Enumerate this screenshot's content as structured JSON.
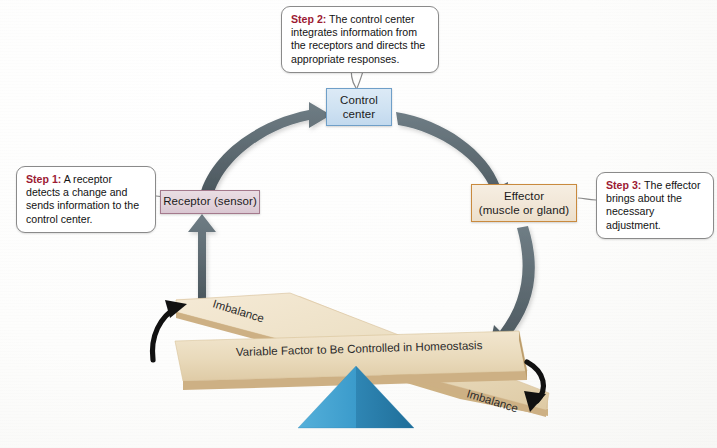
{
  "figure": {
    "background_color": "#fdfdfc"
  },
  "nodes": {
    "control_center": {
      "name": "control-center",
      "line1": "Control",
      "line2": "center",
      "fill": "#cfe2f2",
      "border": "#6f9fc8"
    },
    "receptor": {
      "name": "receptor",
      "label": "Receptor (sensor)",
      "fill": "#e2d2da",
      "border": "#a4798c"
    },
    "effector": {
      "name": "effector",
      "line1": "Effector",
      "line2": "(muscle or gland)",
      "fill": "#f1e6d6",
      "border": "#c98a3e"
    }
  },
  "callouts": [
    {
      "id": "step-1",
      "step_label": "Step 1:",
      "text": " A receptor detects a change and sends information to the control center.",
      "step_color": "#9c1b34"
    },
    {
      "id": "step-2",
      "step_label": "Step 2:",
      "text": " The control center integrates information from the receptors and directs the appropriate responses.",
      "step_color": "#9c1b34"
    },
    {
      "id": "step-3",
      "step_label": "Step 3:",
      "text": " The effector brings about the necessary adjustment.",
      "step_color": "#9c1b34"
    }
  ],
  "seesaw": {
    "beam_main_label": "Variable Factor to Be Controlled in Homeostasis",
    "beam_left_label": "Imbalance",
    "beam_right_label": "Imbalance",
    "beam_color": "#e8d9bd",
    "beam_edge_color": "#c9ab7d",
    "fulcrum_color_light": "#3f9fd0",
    "fulcrum_color_dark": "#2a7fae",
    "fulcrum_name": "pyramid-fulcrum"
  },
  "arrows": {
    "cycle_color": "#5e6b72",
    "imbalance_color": "#111111",
    "cycle": [
      {
        "id": "receptor-to-control",
        "from": "receptor",
        "to": "control_center"
      },
      {
        "id": "control-to-effector",
        "from": "control_center",
        "to": "effector"
      },
      {
        "id": "effector-to-variable",
        "from": "effector",
        "to": "seesaw_beam"
      },
      {
        "id": "variable-to-receptor",
        "from": "seesaw_beam",
        "to": "receptor"
      }
    ],
    "imbalance": [
      {
        "id": "left-imbalance-arrow",
        "direction": "up-left"
      },
      {
        "id": "right-imbalance-arrow",
        "direction": "down-right"
      }
    ]
  }
}
